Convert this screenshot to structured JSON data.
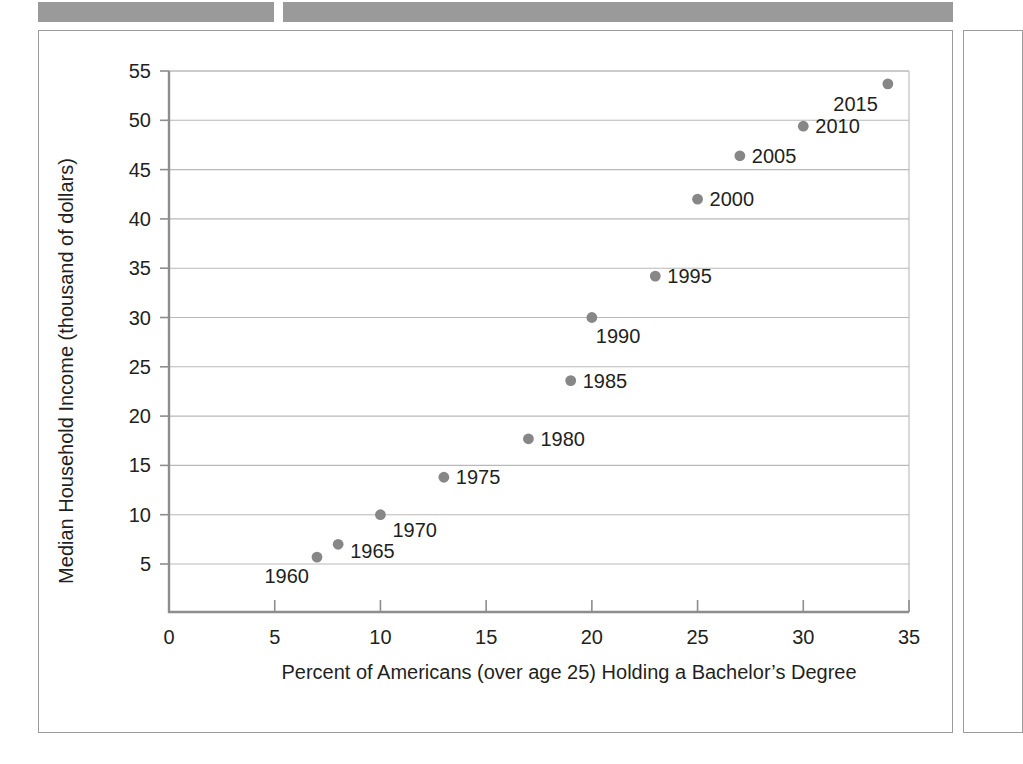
{
  "redacted_bars": [
    {
      "name": "redacted-header-bar-left",
      "color": "#9a9a9a"
    },
    {
      "name": "redacted-header-bar-right",
      "color": "#9a9a9a"
    }
  ],
  "chart_data": {
    "type": "scatter",
    "title": "",
    "xlabel": "Percent of Americans (over age 25) Holding a Bachelor’s Degree",
    "ylabel": "Median Household Income (thousand of dollars)",
    "xlim": [
      0,
      35
    ],
    "ylim": [
      0,
      55
    ],
    "xticks": [
      "0",
      "5",
      "10",
      "15",
      "20",
      "25",
      "30",
      "35"
    ],
    "xtick_values": [
      0,
      5,
      10,
      15,
      20,
      25,
      30,
      35
    ],
    "yticks": [
      "5",
      "10",
      "15",
      "20",
      "25",
      "30",
      "35",
      "40",
      "45",
      "50",
      "55"
    ],
    "ytick_values": [
      5,
      10,
      15,
      20,
      25,
      30,
      35,
      40,
      45,
      50,
      55
    ],
    "grid": "horizontal",
    "legend": "none",
    "marker_color": "#878787",
    "points": [
      {
        "label": "1960",
        "x": 7,
        "y": 5.7,
        "label_dx": -8,
        "label_dy": 26
      },
      {
        "label": "1965",
        "x": 8,
        "y": 7.0,
        "label_dx": 12,
        "label_dy": 14
      },
      {
        "label": "1970",
        "x": 10,
        "y": 10.0,
        "label_dx": 12,
        "label_dy": 22
      },
      {
        "label": "1975",
        "x": 13,
        "y": 13.8,
        "label_dx": 12,
        "label_dy": 7
      },
      {
        "label": "1980",
        "x": 17,
        "y": 17.7,
        "label_dx": 12,
        "label_dy": 7
      },
      {
        "label": "1985",
        "x": 19,
        "y": 23.6,
        "label_dx": 12,
        "label_dy": 7
      },
      {
        "label": "1990",
        "x": 20,
        "y": 30.0,
        "label_dx": 4,
        "label_dy": 25
      },
      {
        "label": "1995",
        "x": 23,
        "y": 34.2,
        "label_dx": 12,
        "label_dy": 7
      },
      {
        "label": "2000",
        "x": 25,
        "y": 42.0,
        "label_dx": 12,
        "label_dy": 7
      },
      {
        "label": "2005",
        "x": 27,
        "y": 46.4,
        "label_dx": 12,
        "label_dy": 7
      },
      {
        "label": "2010",
        "x": 30,
        "y": 49.4,
        "label_dx": 12,
        "label_dy": 7
      },
      {
        "label": "2015",
        "x": 34,
        "y": 53.7,
        "label_dx": -10,
        "label_dy": 27
      }
    ]
  }
}
